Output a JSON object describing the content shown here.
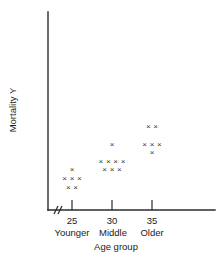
{
  "chart_data": {
    "type": "scatter",
    "title": "",
    "xlabel": "Age group",
    "ylabel": "Mortality Y",
    "grid": false,
    "legend": null,
    "x_tick_values": [
      "25",
      "30",
      "35"
    ],
    "x_tick_group_labels": [
      "Younger",
      "Middle",
      "Older"
    ],
    "y_tick_values": [],
    "axis_break": true,
    "marker_glyph": "×",
    "note": "Strip/dot plot; each x mark is one observation stacked in rows at each age group.",
    "series": [
      {
        "name": "Younger",
        "x": 25,
        "x_label": "25",
        "group_label": "Younger",
        "count": 6,
        "rows": [
          {
            "level": 3,
            "marks": 1
          },
          {
            "level": 2,
            "marks": 3
          },
          {
            "level": 1,
            "marks": 2
          }
        ]
      },
      {
        "name": "Middle",
        "x": 30,
        "x_label": "30",
        "group_label": "Middle",
        "count": 8,
        "rows": [
          {
            "level": 6,
            "marks": 1
          },
          {
            "level": 4,
            "marks": 4
          },
          {
            "level": 3,
            "marks": 3
          }
        ]
      },
      {
        "name": "Older",
        "x": 35,
        "x_label": "35",
        "group_label": "Older",
        "count": 6,
        "rows": [
          {
            "level": 8,
            "marks": 2
          },
          {
            "level": 6,
            "marks": 3
          },
          {
            "level": 5,
            "marks": 1
          }
        ]
      }
    ],
    "colors": {
      "axis": "#2b2b2b",
      "marker": "#3a3a3a",
      "background": "#ffffff",
      "text": "#1a1a1a"
    }
  },
  "axis": {
    "x_title": "Age group",
    "y_title": "Mortality Y"
  },
  "ticks": [
    {
      "value": "25",
      "group": "Younger"
    },
    {
      "value": "30",
      "group": "Middle"
    },
    {
      "value": "35",
      "group": "Older"
    }
  ]
}
